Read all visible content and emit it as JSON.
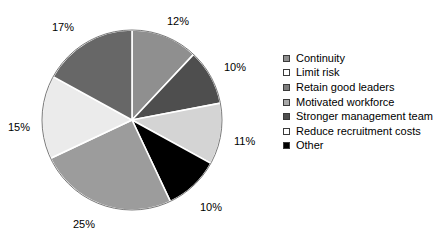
{
  "chart_data": {
    "type": "pie",
    "title": "",
    "labels": [
      "Continuity",
      "Limit risk",
      "Retain good leaders",
      "Motivated workforce",
      "Stronger management team",
      "Reduce recruitment costs",
      "Other"
    ],
    "values": [
      12,
      10,
      11,
      10,
      25,
      15,
      17
    ],
    "value_labels": [
      "12%",
      "10%",
      "11%",
      "10%",
      "25%",
      "15%",
      "17%"
    ],
    "colors": [
      "#8f8f8f",
      "#4e4e4e",
      "#d4d4d4",
      "#000000",
      "#9c9c9c",
      "#ebebeb",
      "#676767"
    ],
    "legend_position": "right",
    "grid": false,
    "start_angle_deg": 0,
    "direction": "clockwise"
  },
  "pie": {
    "center_x": 132,
    "center_y": 120,
    "radius": 90,
    "slices": [
      {
        "label": "Continuity",
        "value": 12,
        "value_label": "12%",
        "color": "#8f8f8f",
        "label_x": 167,
        "label_y": 16
      },
      {
        "label": "Limit risk",
        "value": 10,
        "value_label": "10%",
        "color": "#4e4e4e",
        "label_x": 224,
        "label_y": 62
      },
      {
        "label": "Retain good leaders",
        "value": 11,
        "value_label": "11%",
        "color": "#d4d4d4",
        "label_x": 234,
        "label_y": 136
      },
      {
        "label": "Motivated workforce",
        "value": 10,
        "value_label": "10%",
        "color": "#000000",
        "label_x": 200,
        "label_y": 202
      },
      {
        "label": "Stronger management team",
        "value": 25,
        "value_label": "25%",
        "color": "#9c9c9c",
        "label_x": 73,
        "label_y": 219
      },
      {
        "label": "Reduce recruitment costs",
        "value": 15,
        "value_label": "15%",
        "color": "#ebebeb",
        "label_x": 8,
        "label_y": 122
      },
      {
        "label": "Other",
        "value": 17,
        "value_label": "17%",
        "color": "#676767",
        "label_x": 52,
        "label_y": 22
      }
    ]
  },
  "legend": {
    "items": [
      {
        "label": "Continuity",
        "color": "#8f8f8f"
      },
      {
        "label": "Limit risk",
        "color": "#ffffff"
      },
      {
        "label": "Retain good leaders",
        "color": "#7d7d7d"
      },
      {
        "label": "Motivated workforce",
        "color": "#a8a8a8"
      },
      {
        "label": "Stronger management team",
        "color": "#4e4e4e"
      },
      {
        "label": "Reduce recruitment costs",
        "color": "#ffffff"
      },
      {
        "label": "Other",
        "color": "#000000"
      }
    ]
  }
}
